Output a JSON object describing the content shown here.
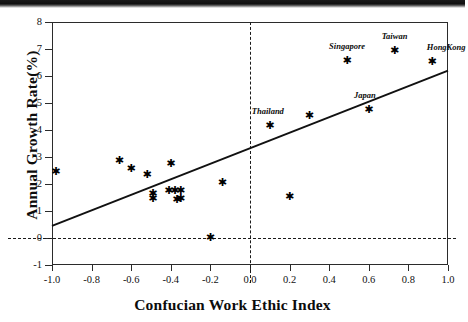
{
  "figure": {
    "scan_artifact": "dark-scan-bar"
  },
  "chart_data": {
    "type": "scatter",
    "title": "",
    "subtitle": "",
    "xlabel": "Confucian Work Ethic Index",
    "ylabel": "Annual Growth Rate(%)",
    "xlim": [
      -1.0,
      1.0
    ],
    "ylim": [
      -1,
      8
    ],
    "xticks": [
      -1.0,
      -0.8,
      -0.6,
      -0.4,
      -0.2,
      0.0,
      0.2,
      0.4,
      0.6,
      0.8,
      1.0
    ],
    "xtick_labels": [
      "-1.0",
      "-0.8",
      "-0.6",
      "-0.4",
      "-0.2",
      "0.0",
      "0.2",
      "0.4",
      "0.6",
      "0.8",
      "1.0"
    ],
    "yticks": [
      -1,
      0,
      1,
      2,
      3,
      4,
      5,
      6,
      7,
      8
    ],
    "ytick_labels": [
      "-1",
      "0",
      "1",
      "2",
      "3",
      "4",
      "5",
      "6",
      "7",
      "8"
    ],
    "grid": false,
    "legend": null,
    "marker": "asterisk",
    "reference_lines": [
      {
        "name": "y-zero-line",
        "orientation": "horizontal",
        "value": 0,
        "style": "dashed"
      },
      {
        "name": "x-zero-line",
        "orientation": "vertical",
        "value": 0.0,
        "style": "dashed"
      }
    ],
    "fit_line": {
      "name": "regression-line",
      "style": "solid",
      "x_start": -1.0,
      "y_start": 0.45,
      "x_end": 1.0,
      "y_end": 6.2
    },
    "points": [
      {
        "x": -0.98,
        "y": 2.5,
        "label": ""
      },
      {
        "x": -0.66,
        "y": 2.89,
        "label": ""
      },
      {
        "x": -0.6,
        "y": 2.58,
        "label": ""
      },
      {
        "x": -0.52,
        "y": 2.38,
        "label": ""
      },
      {
        "x": -0.49,
        "y": 1.67,
        "label": ""
      },
      {
        "x": -0.49,
        "y": 1.48,
        "label": ""
      },
      {
        "x": -0.41,
        "y": 1.78,
        "label": ""
      },
      {
        "x": -0.4,
        "y": 2.78,
        "label": ""
      },
      {
        "x": -0.38,
        "y": 1.78,
        "label": ""
      },
      {
        "x": -0.37,
        "y": 1.45,
        "label": ""
      },
      {
        "x": -0.35,
        "y": 1.78,
        "label": ""
      },
      {
        "x": -0.35,
        "y": 1.48,
        "label": ""
      },
      {
        "x": -0.2,
        "y": 0.03,
        "label": ""
      },
      {
        "x": -0.14,
        "y": 2.08,
        "label": ""
      },
      {
        "x": 0.1,
        "y": 4.18,
        "label": "Thailand"
      },
      {
        "x": 0.2,
        "y": 1.57,
        "label": ""
      },
      {
        "x": 0.3,
        "y": 4.57,
        "label": ""
      },
      {
        "x": 0.49,
        "y": 6.58,
        "label": "Singapore"
      },
      {
        "x": 0.6,
        "y": 4.76,
        "label": "Japan"
      },
      {
        "x": 0.73,
        "y": 6.97,
        "label": "Taiwan"
      },
      {
        "x": 0.92,
        "y": 6.57,
        "label": "HongKong"
      }
    ],
    "annotations": [
      {
        "text": "Thailand",
        "x": 0.1,
        "y": 4.18
      },
      {
        "text": "Singapore",
        "x": 0.49,
        "y": 6.58
      },
      {
        "text": "Japan",
        "x": 0.6,
        "y": 4.76
      },
      {
        "text": "Taiwan",
        "x": 0.73,
        "y": 6.97
      },
      {
        "text": "HongKong",
        "x": 0.92,
        "y": 6.57
      }
    ],
    "colors": {
      "marker": "#000000",
      "line": "#111111",
      "axis": "#2b2b2b",
      "background": "#ffffff"
    }
  }
}
